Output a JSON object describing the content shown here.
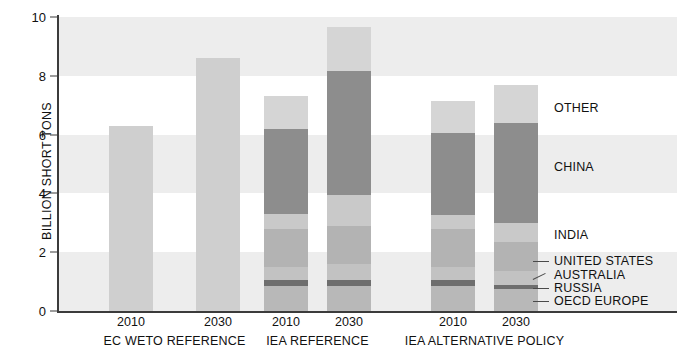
{
  "chart_data": {
    "type": "bar",
    "subtype": "stacked-bar-grouped",
    "title": "",
    "xlabel": "",
    "ylabel": "BILLION SHORT TONS",
    "ylim": [
      0,
      10
    ],
    "yticks": [
      0,
      2,
      4,
      6,
      8,
      10
    ],
    "grid": "horizontal-alternating-bands",
    "legend_position": "right-inline",
    "groups": [
      {
        "name": "EC WETO REFERENCE",
        "bars": [
          {
            "category": "2010",
            "total": 6.3,
            "stacked": false,
            "segments": [
              {
                "series": "TOTAL",
                "value": 6.3
              }
            ]
          },
          {
            "category": "2030",
            "total": 8.6,
            "stacked": false,
            "segments": [
              {
                "series": "TOTAL",
                "value": 8.6
              }
            ]
          }
        ]
      },
      {
        "name": "IEA REFERENCE",
        "bars": [
          {
            "category": "2010",
            "total": 7.3,
            "stacked": true,
            "segments": [
              {
                "series": "OECD EUROPE",
                "value": 0.85
              },
              {
                "series": "RUSSIA",
                "value": 0.2
              },
              {
                "series": "AUSTRALIA",
                "value": 0.45
              },
              {
                "series": "UNITED STATES",
                "value": 1.3
              },
              {
                "series": "INDIA",
                "value": 0.5
              },
              {
                "series": "CHINA",
                "value": 2.9
              },
              {
                "series": "OTHER",
                "value": 1.1
              }
            ]
          },
          {
            "category": "2030",
            "total": 9.65,
            "stacked": true,
            "segments": [
              {
                "series": "OECD EUROPE",
                "value": 0.85
              },
              {
                "series": "RUSSIA",
                "value": 0.2
              },
              {
                "series": "AUSTRALIA",
                "value": 0.55
              },
              {
                "series": "UNITED STATES",
                "value": 1.3
              },
              {
                "series": "INDIA",
                "value": 1.05
              },
              {
                "series": "CHINA",
                "value": 4.2
              },
              {
                "series": "OTHER",
                "value": 1.5
              }
            ]
          }
        ]
      },
      {
        "name": "IEA ALTERNATIVE POLICY",
        "bars": [
          {
            "category": "2010",
            "total": 7.15,
            "stacked": true,
            "segments": [
              {
                "series": "OECD EUROPE",
                "value": 0.85
              },
              {
                "series": "RUSSIA",
                "value": 0.2
              },
              {
                "series": "AUSTRALIA",
                "value": 0.45
              },
              {
                "series": "UNITED STATES",
                "value": 1.3
              },
              {
                "series": "INDIA",
                "value": 0.45
              },
              {
                "series": "CHINA",
                "value": 2.8
              },
              {
                "series": "OTHER",
                "value": 1.1
              }
            ]
          },
          {
            "category": "2030",
            "total": 7.7,
            "stacked": true,
            "segments": [
              {
                "series": "OECD EUROPE",
                "value": 0.75
              },
              {
                "series": "RUSSIA",
                "value": 0.15
              },
              {
                "series": "AUSTRALIA",
                "value": 0.45
              },
              {
                "series": "UNITED STATES",
                "value": 1.0
              },
              {
                "series": "INDIA",
                "value": 0.65
              },
              {
                "series": "CHINA",
                "value": 3.4
              },
              {
                "series": "OTHER",
                "value": 1.3
              }
            ]
          }
        ]
      }
    ],
    "series_colors": {
      "TOTAL": "#cfcfcf",
      "OTHER": "#d5d5d5",
      "CHINA": "#8d8d8d",
      "INDIA": "#c9c9c9",
      "UNITED STATES": "#b3b3b3",
      "AUSTRALIA": "#c2c2c2",
      "RUSSIA": "#6e6e6e",
      "OECD EUROPE": "#b8b8b8"
    },
    "legend": [
      {
        "label": "OTHER"
      },
      {
        "label": "CHINA"
      },
      {
        "label": "INDIA"
      },
      {
        "label": "UNITED STATES"
      },
      {
        "label": "AUSTRALIA"
      },
      {
        "label": "RUSSIA"
      },
      {
        "label": "OECD EUROPE"
      }
    ]
  },
  "axis": {
    "y_title": "BILLION SHORT TONS",
    "y_tick_labels": [
      "10",
      "8",
      "6",
      "4",
      "2",
      "0"
    ]
  },
  "x_axis": {
    "bar_labels": [
      "2010",
      "2030",
      "2010",
      "2030",
      "2010",
      "2030"
    ],
    "group_labels": [
      "EC WETO REFERENCE",
      "IEA REFERENCE",
      "IEA ALTERNATIVE POLICY"
    ]
  },
  "legend_labels": {
    "other": "OTHER",
    "china": "CHINA",
    "india": "INDIA",
    "united_states": "UNITED STATES",
    "australia": "AUSTRALIA",
    "russia": "RUSSIA",
    "oecd_europe": "OECD EUROPE"
  },
  "colors": {
    "background": "#ffffff",
    "band": "#ededed",
    "axis": "#3b3b3b",
    "text": "#111111",
    "solid_bar": "#cfcfcf",
    "other": "#d5d5d5",
    "china": "#8d8d8d",
    "india": "#c9c9c9",
    "united_states": "#b3b3b3",
    "australia": "#c2c2c2",
    "russia": "#6e6e6e",
    "oecd_europe": "#b8b8b8"
  }
}
